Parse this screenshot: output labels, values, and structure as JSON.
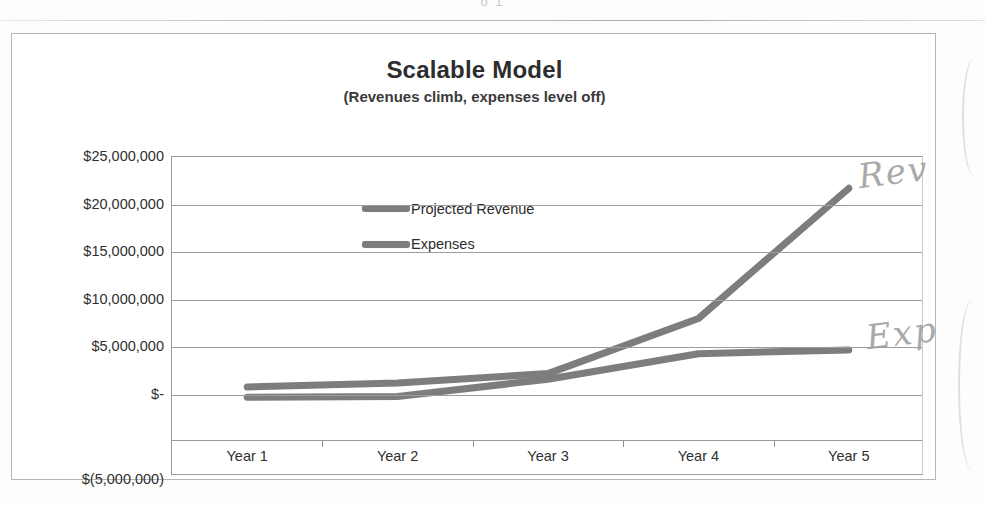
{
  "page": {
    "top_partial_text": "o                 1"
  },
  "chart": {
    "title": "Scalable Model",
    "subtitle": "(Revenues climb, expenses level off)",
    "legend": [
      {
        "label": "Projected Revenue",
        "color": "#7d7d7d"
      },
      {
        "label": "Expenses",
        "color": "#7d7d7d"
      }
    ]
  },
  "annotations": [
    {
      "name": "rev-handwritten-note",
      "text": "Rev"
    },
    {
      "name": "exp-handwritten-note",
      "text": "Exp"
    }
  ],
  "chart_data": {
    "type": "line",
    "title": "Scalable Model",
    "subtitle": "(Revenues climb, expenses level off)",
    "xlabel": "",
    "ylabel": "",
    "categories": [
      "Year 1",
      "Year 2",
      "Year 3",
      "Year 4",
      "Year 5"
    ],
    "ytick_labels": [
      "$25,000,000",
      "$20,000,000",
      "$15,000,000",
      "$10,000,000",
      "$5,000,000",
      "$-",
      "$(5,000,000)"
    ],
    "ytick_values": [
      25000000,
      20000000,
      15000000,
      10000000,
      5000000,
      0,
      -5000000
    ],
    "ylim": [
      -5000000,
      25000000
    ],
    "grid": true,
    "legend_position": "inside-upper-center",
    "series": [
      {
        "name": "Projected Revenue",
        "color": "#7d7d7d",
        "values": [
          800000,
          1200000,
          2200000,
          8000000,
          21700000
        ]
      },
      {
        "name": "Expenses",
        "color": "#7d7d7d",
        "values": [
          -300000,
          -200000,
          1600000,
          4300000,
          4700000
        ]
      }
    ]
  }
}
